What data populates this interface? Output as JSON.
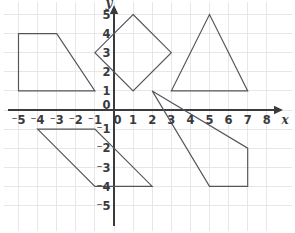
{
  "figure": {
    "background_color": "#ffffff",
    "grid_color": "#e9e6ea",
    "axis_color": "#3b3b3f",
    "shape_stroke_color": "#55545a",
    "label_color": "#3a3a3e"
  },
  "chart_data": {
    "type": "scatter",
    "title": "",
    "xlabel": "x",
    "ylabel": "y",
    "grid": true,
    "legend": "none",
    "xlim": [
      -5.5,
      8.5
    ],
    "ylim": [
      -5.7,
      5.7
    ],
    "x_ticks": [
      -5,
      -4,
      -3,
      -2,
      -1,
      0,
      1,
      2,
      3,
      4,
      5,
      6,
      7,
      8
    ],
    "y_ticks": [
      5,
      4,
      3,
      2,
      1,
      0,
      -1,
      -2,
      -3,
      -4,
      -5
    ],
    "x_tick_labels": [
      "⁻5",
      "⁻4",
      "⁻3",
      "⁻2",
      "⁻1",
      "0",
      "1",
      "2",
      "3",
      "4",
      "5",
      "6",
      "7",
      "8"
    ],
    "y_tick_labels": [
      "5",
      "4",
      "3",
      "2",
      "1",
      "0",
      "⁻1",
      "⁻2",
      "⁻3",
      "⁻4",
      "⁻5"
    ],
    "x_axis_arrow": "right",
    "y_axis_arrow": "up",
    "shapes": [
      {
        "name": "trapezoid-upper-left",
        "kind": "polygon",
        "sides": 4,
        "vertices": [
          [
            -5,
            4
          ],
          [
            -3,
            4
          ],
          [
            -1,
            1
          ],
          [
            -5,
            1
          ]
        ],
        "closed": true
      },
      {
        "name": "square-diamond-center",
        "kind": "polygon",
        "sides": 4,
        "vertices": [
          [
            1,
            5
          ],
          [
            3,
            3
          ],
          [
            1,
            1
          ],
          [
            -1,
            3
          ]
        ],
        "closed": true
      },
      {
        "name": "triangle-upper-right",
        "kind": "polygon",
        "sides": 3,
        "vertices": [
          [
            3,
            1
          ],
          [
            5,
            5
          ],
          [
            7,
            1
          ]
        ],
        "closed": true
      },
      {
        "name": "parallelogram-lower-left",
        "kind": "polygon",
        "sides": 4,
        "vertices": [
          [
            -4,
            -1
          ],
          [
            -1,
            -1
          ],
          [
            2,
            -4
          ],
          [
            -1,
            -4
          ]
        ],
        "closed": true
      },
      {
        "name": "quadrilateral-lower-right",
        "kind": "polygon",
        "sides": 4,
        "vertices": [
          [
            2,
            1
          ],
          [
            7,
            -2
          ],
          [
            7,
            -4
          ],
          [
            5,
            -4
          ]
        ],
        "closed": true
      }
    ]
  }
}
